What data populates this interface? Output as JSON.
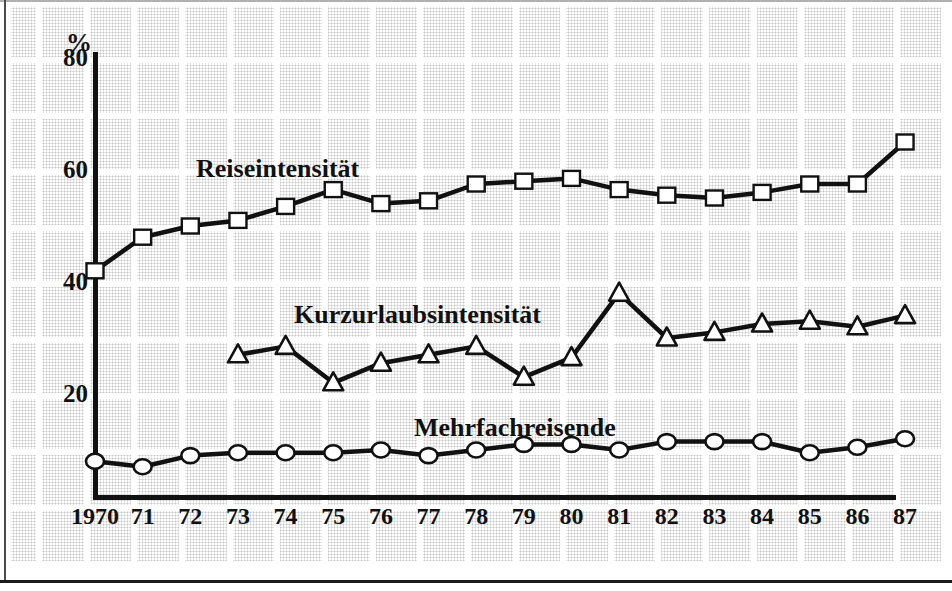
{
  "figure": {
    "background": "#ffffff",
    "ink_color": "#111111",
    "halftone_color": "#c7c7c7",
    "marker_fill": "#ffffff"
  },
  "chart_data": {
    "type": "line",
    "title": "",
    "xlabel": "",
    "ylabel": "%",
    "ylim": [
      0,
      80
    ],
    "y_ticks": [
      80,
      60,
      40,
      20
    ],
    "y_tick_labels": [
      "80",
      "60",
      "40",
      "20"
    ],
    "x_tick_labels": [
      "1970",
      "71",
      "72",
      "73",
      "74",
      "75",
      "76",
      "77",
      "78",
      "79",
      "80",
      "81",
      "82",
      "83",
      "84",
      "85",
      "86",
      "87"
    ],
    "grid": "halftone paper blocks with white gutters",
    "legend_position": "inline labels above each line",
    "series": [
      {
        "name": "Reiseintensität",
        "marker": "square",
        "start_year": "1970",
        "values": [
          42,
          48,
          50,
          51,
          53.5,
          56.5,
          54,
          54.5,
          57.5,
          58,
          58.5,
          56.5,
          55.5,
          55,
          56,
          57.5,
          57.5,
          65
        ]
      },
      {
        "name": "Kurzurlaubsintensität",
        "marker": "triangle",
        "start_year": "73",
        "values": [
          27,
          28.5,
          22,
          25.5,
          27,
          28.5,
          23,
          26.5,
          38,
          30,
          31,
          32.5,
          33,
          32,
          34
        ]
      },
      {
        "name": "Mehrfachreisende",
        "marker": "circle",
        "start_year": "1970",
        "values": [
          8,
          7,
          9,
          9.5,
          9.5,
          9.5,
          10,
          9,
          10,
          11,
          11,
          10,
          11.5,
          11.5,
          11.5,
          9.5,
          10.5,
          12
        ]
      }
    ]
  }
}
